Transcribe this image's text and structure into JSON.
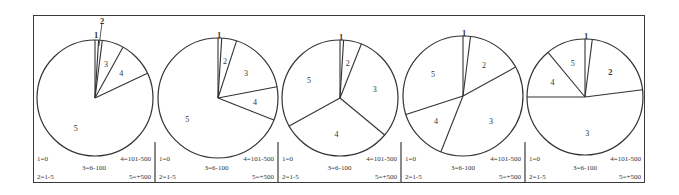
{
  "legend": {
    "1": "1=0",
    "2": "2=1-5",
    "3": "3=6-100",
    "4": "4=101-500",
    "5": "5=+500"
  },
  "chart_data": [
    {
      "type": "pie",
      "title": "",
      "categories": [
        "1=0",
        "2=1-5",
        "3=6-100",
        "4=101-500",
        "5=+500"
      ],
      "labels": [
        "1",
        "2",
        "3",
        "4",
        "5"
      ],
      "values": [
        1,
        1,
        6,
        10,
        82
      ]
    },
    {
      "type": "pie",
      "title": "",
      "categories": [
        "1=0",
        "2=1-5",
        "3=6-100",
        "4=101-500",
        "5=+500"
      ],
      "labels": [
        "1",
        "2",
        "3",
        "4",
        "5"
      ],
      "values": [
        1,
        4,
        17,
        9,
        69
      ]
    },
    {
      "type": "pie",
      "title": "",
      "categories": [
        "1=0",
        "2=1-5",
        "3=6-100",
        "4=101-500",
        "5=+500"
      ],
      "labels": [
        "1",
        "2",
        "3",
        "4",
        "5"
      ],
      "values": [
        1,
        5,
        30,
        31,
        33
      ]
    },
    {
      "type": "pie",
      "title": "",
      "categories": [
        "1=0",
        "2=1-5",
        "3=6-100",
        "4=101-500",
        "5=+500"
      ],
      "labels": [
        "1",
        "2",
        "3",
        "4",
        "5"
      ],
      "values": [
        2,
        15,
        39,
        14,
        30
      ]
    },
    {
      "type": "pie",
      "title": "",
      "categories": [
        "1=0",
        "2=1-5",
        "3=6-100",
        "4=101-500",
        "5=+500"
      ],
      "labels": [
        "1",
        "2",
        "3",
        "4",
        "5"
      ],
      "values": [
        2,
        21,
        52,
        14,
        11
      ]
    }
  ]
}
